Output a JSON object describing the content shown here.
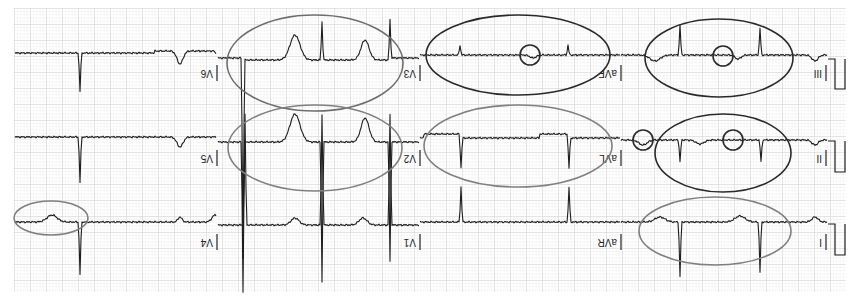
{
  "figure": {
    "orientation": "rotated-180",
    "colors": {
      "grid_minor": "#e4e4e4",
      "grid_major": "#c9c9c9",
      "trace": "#1e1e1e",
      "annotation_dark": "#2a2a2a",
      "annotation_gray": "#808080"
    }
  },
  "rows": [
    {
      "leads": [
        "V6",
        "V3",
        "aVF",
        "III"
      ]
    },
    {
      "leads": [
        "V5",
        "V2",
        "aVL",
        "II"
      ]
    },
    {
      "leads": [
        "V4",
        "V1",
        "aVR",
        "I"
      ]
    }
  ],
  "labels": {
    "row1": [
      "V6",
      "V3",
      "aVF",
      "III"
    ],
    "row2": [
      "V5",
      "V2",
      "aVL",
      "II"
    ],
    "row3": [
      "V4",
      "V1",
      "aVR",
      "I"
    ]
  },
  "annotations": [
    {
      "lead": "V3",
      "shape": "ellipse",
      "tone": "gray-dark"
    },
    {
      "lead": "aVF",
      "shape": "ellipse",
      "tone": "dark"
    },
    {
      "lead": "aVF",
      "shape": "circle",
      "tone": "dark"
    },
    {
      "lead": "III",
      "shape": "ellipse",
      "tone": "dark"
    },
    {
      "lead": "III",
      "shape": "circle",
      "tone": "dark"
    },
    {
      "lead": "V2",
      "shape": "ellipse",
      "tone": "gray"
    },
    {
      "lead": "aVL",
      "shape": "ellipse",
      "tone": "gray"
    },
    {
      "lead": "aVL",
      "shape": "circle",
      "tone": "dark"
    },
    {
      "lead": "II",
      "shape": "ellipse",
      "tone": "dark"
    },
    {
      "lead": "II",
      "shape": "circle",
      "tone": "dark"
    },
    {
      "lead": "I",
      "shape": "ellipse",
      "tone": "gray"
    },
    {
      "lead": "V4",
      "shape": "ellipse",
      "tone": "gray"
    }
  ]
}
